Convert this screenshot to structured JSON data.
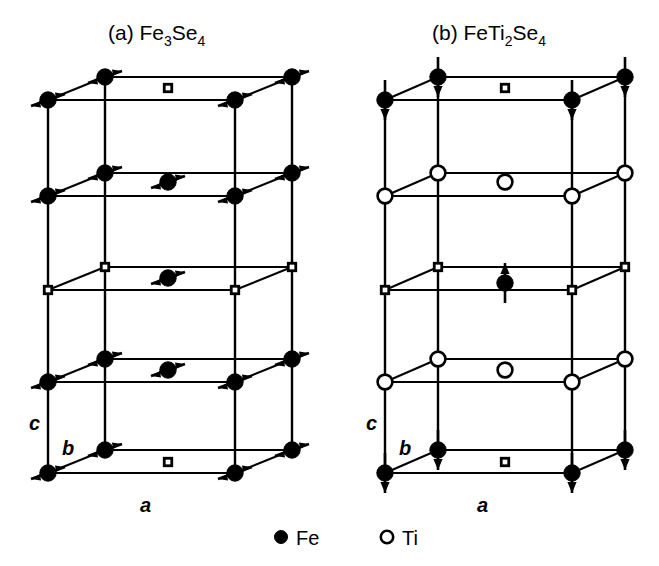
{
  "figure": {
    "caption_present": false,
    "background_color": "#ffffff",
    "ink_color": "#000000"
  },
  "panels": [
    {
      "id": "panel-a",
      "label": "(a)",
      "formula_parts": [
        {
          "text": "(a) Fe",
          "sub": false
        },
        {
          "text": "3",
          "sub": true
        },
        {
          "text": "Se",
          "sub": false
        },
        {
          "text": "4",
          "sub": true
        }
      ],
      "title_plain": "(a) Fe3Se4",
      "spin_orientation": "in-plane",
      "axes": [
        {
          "name": "c",
          "label": "c"
        },
        {
          "name": "b",
          "label": "b"
        },
        {
          "name": "a",
          "label": "a"
        }
      ]
    },
    {
      "id": "panel-b",
      "label": "(b)",
      "formula_parts": [
        {
          "text": "(b) FeTi",
          "sub": false
        },
        {
          "text": "2",
          "sub": true
        },
        {
          "text": "Se",
          "sub": false
        },
        {
          "text": "4",
          "sub": true
        }
      ],
      "title_plain": "(b) FeTi2Se4",
      "spin_orientation": "along-c",
      "axes": [
        {
          "name": "c",
          "label": "c"
        },
        {
          "name": "b",
          "label": "b"
        },
        {
          "name": "a",
          "label": "a"
        }
      ]
    }
  ],
  "legend": {
    "items": [
      {
        "marker": "filled-circle",
        "label": "Fe",
        "color": "#000000"
      },
      {
        "marker": "open-circle",
        "label": "Ti",
        "color": "#000000"
      }
    ]
  },
  "structure_data": {
    "type": "crystal-magnetic-structure",
    "description": "Stacked monoclinic cells viewed in oblique projection; five c-layers per panel",
    "layer_count": 5,
    "layer_kinds_panel_a": [
      "Fe-spin-right",
      "Fe-spin-right",
      "vacancy",
      "Fe-spin-right",
      "Fe-spin-right"
    ],
    "layer_kinds_panel_b": [
      "Fe-spin-down",
      "Ti",
      "vacancy",
      "Ti",
      "Fe-spin-down"
    ],
    "center_sites_panel_a": [
      "vacancy",
      "Fe-spin-right",
      "Fe-spin-right",
      "Fe-spin-right",
      "vacancy"
    ],
    "center_sites_panel_b": [
      "vacancy",
      "Ti",
      "Fe-spin-up",
      "Ti",
      "vacancy"
    ],
    "markers": {
      "filled-circle": "Fe atom",
      "open-circle": "Ti atom",
      "open-square": "cation vacancy"
    },
    "panel_a_geometry": {
      "front_left_x": 48,
      "front_right_x": 235,
      "depth_dx": 57,
      "depth_dy": -23,
      "layer_y": [
        100,
        196,
        290,
        382,
        473
      ],
      "center_x": 168,
      "center_y": [
        88,
        182,
        278,
        370,
        462
      ]
    },
    "panel_b_geometry": {
      "front_left_x": 385,
      "front_right_x": 572,
      "depth_dx": 53,
      "depth_dy": -23,
      "layer_y": [
        100,
        196,
        290,
        382,
        473
      ],
      "center_x": 505,
      "center_y": [
        88,
        182,
        283,
        370,
        462
      ]
    }
  }
}
